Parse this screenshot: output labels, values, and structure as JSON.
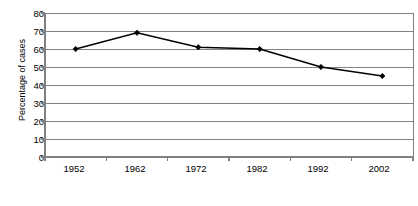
{
  "chart_data": {
    "type": "line",
    "title": "",
    "xlabel": "",
    "ylabel": "Percentage of cases",
    "categories": [
      "1952",
      "1962",
      "1972",
      "1982",
      "1992",
      "2002"
    ],
    "values": [
      60,
      69,
      61,
      60,
      50,
      45
    ],
    "series": [
      {
        "name": "Percentage of cases",
        "values": [
          60,
          69,
          61,
          60,
          50,
          45
        ]
      }
    ],
    "ylim": [
      0,
      80
    ],
    "y_ticks": [
      0,
      10,
      20,
      30,
      40,
      50,
      60,
      70,
      80
    ],
    "y_tick_labels": [
      "0",
      "10",
      "20",
      "30",
      "40",
      "50",
      "60",
      "70",
      "80"
    ],
    "grid": "horizontal",
    "legend": "none",
    "marker": "diamond",
    "line_color": "#000000",
    "marker_color": "#000000",
    "grid_color": "#808080",
    "axis_color": "#808080",
    "background_color": "#ffffff"
  }
}
